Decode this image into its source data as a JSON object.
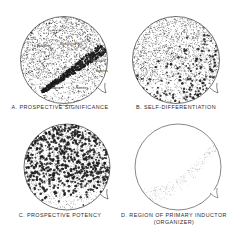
{
  "figure": {
    "background_color": "#ffffff",
    "ink_color": "#1a1a1a"
  },
  "panels": [
    {
      "id": "a",
      "letter": "A.",
      "caption": "A. PROSPECTIVE SIGNIFICANCE",
      "caption_line1": "A. PROSPECTIVE SIGNIFICANCE",
      "caption_line2": "",
      "region_labels": [
        {
          "text": "Ectoderm",
          "x": 30,
          "y": 33
        },
        {
          "text": "Medullary Plate",
          "x": 57,
          "y": 31
        },
        {
          "text": "Notochord",
          "x": 84,
          "y": 48
        },
        {
          "text": "Somites",
          "x": 88,
          "y": 58
        },
        {
          "text": "Lat. Mesoderm",
          "x": 36,
          "y": 75
        },
        {
          "text": "Somites",
          "x": 68,
          "y": 75
        },
        {
          "text": "Entoderm",
          "x": 52,
          "y": 93
        }
      ],
      "stipple_description": "fine stipple overall with dense dark diagonal band from upper right to lower left"
    },
    {
      "id": "b",
      "letter": "B.",
      "caption": "B. SELF-DIFFERENTIATION",
      "caption_line1": "B. SELF-DIFFERENTIATION",
      "caption_line2": "",
      "region_labels": [],
      "stipple_description": "fine stipple overall with coarse dark dots concentrated in lower right quadrant"
    },
    {
      "id": "c",
      "letter": "C.",
      "caption": "C. PROSPECTIVE POTENCY",
      "caption_line1": "C. PROSPECTIVE POTENCY",
      "caption_line2": "",
      "region_labels": [],
      "stipple_description": "coarse dark dots distributed across entire upper two thirds, fading at bottom"
    },
    {
      "id": "d",
      "letter": "D.",
      "caption": "D. REGION OF PRIMARY INDUCTOR (ORGANIZER)",
      "caption_line1": "D. REGION OF PRIMARY INDUCTOR",
      "caption_line2": "(ORGANIZER)",
      "region_labels": [],
      "stipple_description": "mostly blank circle with faint light stippled crescent across lower right"
    }
  ]
}
